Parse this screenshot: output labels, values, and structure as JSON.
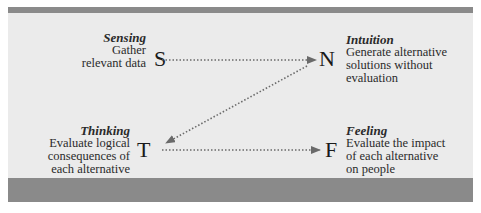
{
  "diagram": {
    "nodes": [
      {
        "id": "S",
        "letter": "S",
        "title": "Sensing",
        "description_lines": [
          "Gather",
          "relevant data"
        ]
      },
      {
        "id": "N",
        "letter": "N",
        "title": "Intuition",
        "description_lines": [
          "Generate alternative",
          "solutions without",
          "evaluation"
        ]
      },
      {
        "id": "T",
        "letter": "T",
        "title": "Thinking",
        "description_lines": [
          "Evaluate logical",
          "consequences of",
          "each alternative"
        ]
      },
      {
        "id": "F",
        "letter": "F",
        "title": "Feeling",
        "description_lines": [
          "Evaluate the impact",
          "of each alternative",
          "on people"
        ]
      }
    ],
    "edges": [
      {
        "from": "S",
        "to": "N",
        "style": "dotted-arrow"
      },
      {
        "from": "N",
        "to": "T",
        "style": "dotted-arrow"
      },
      {
        "from": "T",
        "to": "F",
        "style": "dotted-arrow"
      }
    ],
    "colors": {
      "panel_background": "#ebebeb",
      "bar": "#8a8a8a",
      "arrow": "#666666",
      "text": "#222222"
    }
  }
}
